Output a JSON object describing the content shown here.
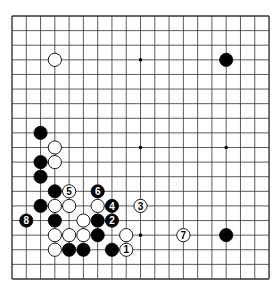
{
  "board": {
    "size": 19,
    "origin": {
      "x": 12,
      "y": 16
    },
    "spacing": {
      "x": 14.28,
      "y": 14.61
    },
    "stone_radius": 6.6,
    "colors": {
      "line": "#333333",
      "black": "#000000",
      "white": "#ffffff",
      "background": "#ffffff"
    },
    "star_points": [
      [
        3,
        3
      ],
      [
        9,
        3
      ],
      [
        15,
        3
      ],
      [
        3,
        9
      ],
      [
        9,
        9
      ],
      [
        15,
        9
      ],
      [
        3,
        15
      ],
      [
        9,
        15
      ],
      [
        15,
        15
      ]
    ],
    "stones": [
      {
        "c": 3,
        "r": 3,
        "color": "white"
      },
      {
        "c": 15,
        "r": 3,
        "color": "black"
      },
      {
        "c": 2,
        "r": 8,
        "color": "black"
      },
      {
        "c": 3,
        "r": 9,
        "color": "white"
      },
      {
        "c": 2,
        "r": 10,
        "color": "black"
      },
      {
        "c": 3,
        "r": 10,
        "color": "white"
      },
      {
        "c": 2,
        "r": 11,
        "color": "black"
      },
      {
        "c": 3,
        "r": 12,
        "color": "black"
      },
      {
        "c": 4,
        "r": 12,
        "color": "white",
        "label": "5"
      },
      {
        "c": 6,
        "r": 12,
        "color": "black",
        "label": "6"
      },
      {
        "c": 2,
        "r": 13,
        "color": "black"
      },
      {
        "c": 3,
        "r": 13,
        "color": "white"
      },
      {
        "c": 4,
        "r": 13,
        "color": "white"
      },
      {
        "c": 6,
        "r": 13,
        "color": "white"
      },
      {
        "c": 7,
        "r": 13,
        "color": "black",
        "label": "4"
      },
      {
        "c": 9,
        "r": 13,
        "color": "white",
        "label": "3"
      },
      {
        "c": 1,
        "r": 14,
        "color": "black",
        "label": "8"
      },
      {
        "c": 3,
        "r": 14,
        "color": "black"
      },
      {
        "c": 5,
        "r": 14,
        "color": "white"
      },
      {
        "c": 6,
        "r": 14,
        "color": "black"
      },
      {
        "c": 7,
        "r": 14,
        "color": "black",
        "label": "2"
      },
      {
        "c": 3,
        "r": 15,
        "color": "white"
      },
      {
        "c": 4,
        "r": 15,
        "color": "white"
      },
      {
        "c": 5,
        "r": 15,
        "color": "white"
      },
      {
        "c": 6,
        "r": 15,
        "color": "black"
      },
      {
        "c": 8,
        "r": 15,
        "color": "white"
      },
      {
        "c": 12,
        "r": 15,
        "color": "white",
        "label": "7"
      },
      {
        "c": 15,
        "r": 15,
        "color": "black"
      },
      {
        "c": 3,
        "r": 16,
        "color": "white"
      },
      {
        "c": 4,
        "r": 16,
        "color": "black"
      },
      {
        "c": 5,
        "r": 16,
        "color": "black"
      },
      {
        "c": 7,
        "r": 16,
        "color": "black"
      },
      {
        "c": 8,
        "r": 16,
        "color": "white",
        "label": "1"
      }
    ]
  }
}
